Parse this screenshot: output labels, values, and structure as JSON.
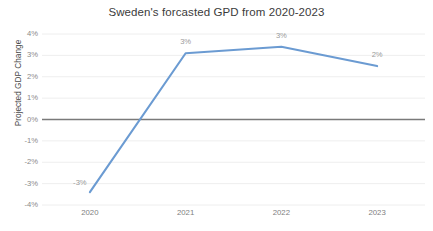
{
  "chart_data": {
    "type": "line",
    "title": "Sweden's forcasted GPD from 2020-2023",
    "xlabel": "",
    "ylabel": "Projected GDP Change",
    "categories": [
      "2020",
      "2021",
      "2022",
      "2023"
    ],
    "values": [
      -3.4,
      3.1,
      3.4,
      2.5
    ],
    "point_labels": [
      "-3%",
      "3%",
      "3%",
      "2%"
    ],
    "ylim": [
      -4,
      4
    ],
    "ytick_values": [
      4,
      3,
      2,
      1,
      0,
      -1,
      -2,
      -3,
      -4
    ],
    "ytick_labels": [
      "4%",
      "3%",
      "2%",
      "1%",
      "0%",
      "-1%",
      "-2%",
      "-3%",
      "-4%"
    ],
    "grid": true,
    "legend": false,
    "series_color": "#6b9bd2",
    "zero_axis_color": "#7a7a7a",
    "grid_color": "#eeeeee",
    "background": "#ffffff"
  }
}
